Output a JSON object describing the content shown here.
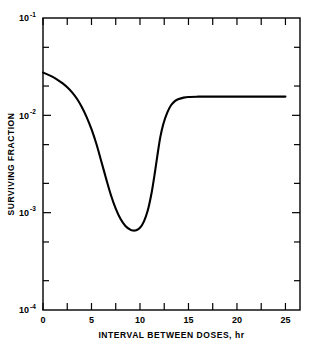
{
  "chart_data": {
    "type": "line",
    "title": "",
    "xlabel": "INTERVAL BETWEEN DOSES, hr",
    "ylabel": "SURVIVING FRACTION",
    "xlim": [
      0,
      26.5
    ],
    "ylim": [
      0.0001,
      0.1
    ],
    "yscale": "log",
    "xscale": "linear",
    "grid": false,
    "legend": null,
    "x_major_ticks": [
      0,
      5,
      10,
      15,
      20,
      25
    ],
    "x_major_tick_labels": [
      "0",
      "5",
      "10",
      "15",
      "20",
      "25"
    ],
    "x_minor_ticks": [
      2.5,
      7.5,
      12.5,
      17.5,
      22.5
    ],
    "y_major_ticks": [
      0.0001,
      0.001,
      0.01,
      0.1
    ],
    "y_major_tick_labels": [
      "10-4",
      "10-3",
      "10-2",
      "10-1"
    ],
    "y_major_tick_mantissas": [
      "10",
      "10",
      "10",
      "10"
    ],
    "y_major_tick_exponents": [
      "-4",
      "-3",
      "-2",
      "-1"
    ],
    "y_minor_ticks": [
      0.0002,
      0.0005,
      0.002,
      0.005,
      0.02,
      0.05
    ],
    "series": [
      {
        "name": "surviving fraction vs interval",
        "x": [
          0.0,
          0.5,
          1.0,
          1.5,
          2.0,
          2.5,
          3.0,
          3.5,
          4.0,
          4.5,
          5.0,
          5.5,
          6.0,
          6.5,
          7.0,
          7.5,
          8.0,
          8.5,
          9.0,
          9.3,
          9.6,
          10.0,
          10.4,
          10.8,
          11.2,
          11.5,
          11.8,
          12.1,
          12.4,
          12.8,
          13.2,
          13.6,
          14.0,
          14.5,
          15.0,
          16.0,
          17.0,
          18.0,
          19.0,
          20.0,
          21.0,
          22.0,
          23.0,
          24.0,
          25.0
        ],
        "y": [
          0.0275,
          0.0262,
          0.0248,
          0.0232,
          0.0214,
          0.0194,
          0.0172,
          0.0148,
          0.0122,
          0.0096,
          0.0072,
          0.0051,
          0.0034,
          0.00225,
          0.00152,
          0.0011,
          0.00086,
          0.00073,
          0.000668,
          0.000655,
          0.00066,
          0.0007,
          0.00081,
          0.00105,
          0.0016,
          0.00245,
          0.0039,
          0.006,
          0.0081,
          0.0106,
          0.0127,
          0.014,
          0.0147,
          0.0152,
          0.01545,
          0.01555,
          0.01558,
          0.01558,
          0.01558,
          0.01558,
          0.01558,
          0.01558,
          0.01558,
          0.01558,
          0.01558
        ]
      }
    ],
    "annotations": [],
    "notes": {
      "start_value": 0.0275,
      "minimum_value": 0.00066,
      "minimum_at_hours": 9.4,
      "plateau_value": 0.0156,
      "plateau_from_hours": 13.5
    }
  },
  "figure": {
    "background_color": "#ffffff",
    "line_color": "#000000",
    "axis_color": "#000000"
  }
}
